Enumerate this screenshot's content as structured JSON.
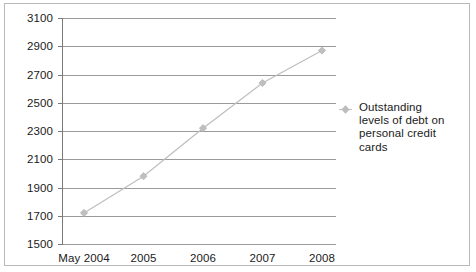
{
  "chart_data": {
    "type": "line",
    "title": "",
    "subtitle": "",
    "xlabel": "",
    "ylabel": "",
    "categories": [
      "May 2004",
      "2005",
      "2006",
      "2007",
      "2008"
    ],
    "series": [
      {
        "name": "Outstanding levels of debt on personal credit cards",
        "values": [
          1720,
          1980,
          2320,
          2640,
          2870
        ],
        "marker": "diamond",
        "color": "#bfbfbf"
      }
    ],
    "ylim": [
      1500,
      3100
    ],
    "ytick_step": 200,
    "yticks": [
      3100,
      2900,
      2700,
      2500,
      2300,
      2100,
      1900,
      1700,
      1500
    ],
    "ytick_labels": [
      "3100",
      "2900",
      "2700",
      "2500",
      "2300",
      "2100",
      "1900",
      "1700",
      "1500"
    ],
    "grid": true,
    "grid_axis": "y",
    "legend_position": "right",
    "grid_color": "#9a9a9a",
    "axis_color": "#7a7a7a",
    "frame_color": "#b9b9b9",
    "background": "#ffffff"
  },
  "legend": {
    "entries": [
      {
        "label": "Outstanding levels of debt on personal credit cards",
        "marker_name": "diamond-marker-icon",
        "color": "#bfbfbf"
      }
    ]
  }
}
